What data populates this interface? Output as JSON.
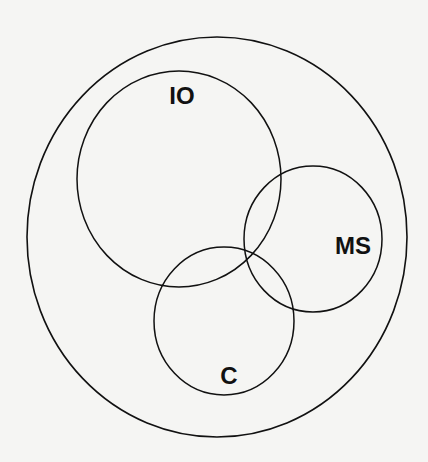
{
  "diagram": {
    "type": "venn",
    "stroke_color": "#111111",
    "background": "#f5f5f3",
    "universe": {
      "cx": 217,
      "cy": 237,
      "rx": 190,
      "ry": 200
    },
    "sets": [
      {
        "id": "IO",
        "label": "IO",
        "cx": 179,
        "cy": 179,
        "rx": 102,
        "ry": 108,
        "label_x": 182,
        "label_y": 104
      },
      {
        "id": "MS",
        "label": "MS",
        "cx": 313,
        "cy": 239,
        "rx": 69,
        "ry": 73,
        "label_x": 353,
        "label_y": 254
      },
      {
        "id": "C",
        "label": "C",
        "cx": 224,
        "cy": 321,
        "rx": 70,
        "ry": 74,
        "label_x": 229,
        "label_y": 384
      }
    ]
  }
}
